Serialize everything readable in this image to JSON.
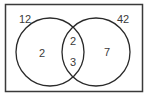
{
  "diagram": {
    "type": "venn",
    "sets": 2,
    "colors": {
      "stroke": "#2a2a2a",
      "text": "#3a3a3a",
      "background": "#ffffff"
    },
    "regions": {
      "outside_left": "12",
      "outside_right": "42",
      "left_only": "2",
      "intersection_top": "2",
      "intersection_bottom": "3",
      "right_only": "7"
    }
  }
}
